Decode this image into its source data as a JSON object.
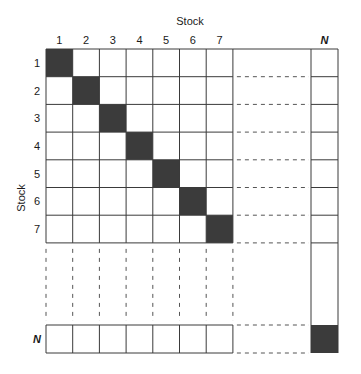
{
  "diagram": {
    "type": "correlation-matrix-grid",
    "top_axis_title": "Stock",
    "left_axis_title": "Stock",
    "column_labels": [
      "1",
      "2",
      "3",
      "4",
      "5",
      "6",
      "7"
    ],
    "row_labels": [
      "1",
      "2",
      "3",
      "4",
      "5",
      "6",
      "7"
    ],
    "last_label": "N",
    "diagonal_fill": "#3b3b3b",
    "line_color": "#3a3a3a",
    "dash_color": "#555555",
    "filled_cells": [
      [
        1,
        1
      ],
      [
        2,
        2
      ],
      [
        3,
        3
      ],
      [
        4,
        4
      ],
      [
        5,
        5
      ],
      [
        6,
        6
      ],
      [
        7,
        7
      ],
      [
        "N",
        "N"
      ]
    ]
  }
}
